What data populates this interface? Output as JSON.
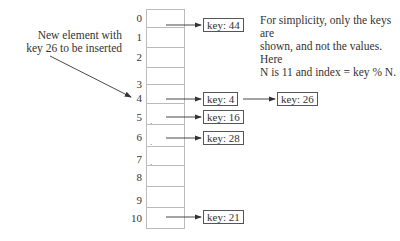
{
  "annotation": {
    "line1": "New element with",
    "line2": "key 26 to be inserted"
  },
  "note": {
    "line1": "For simplicity, only the keys are",
    "line2": "shown, and not the values. Here",
    "line3": "N is 11 and index = key % N."
  },
  "table": {
    "indices": [
      "0",
      "1",
      "2",
      "3",
      "4",
      "5",
      "6",
      "7",
      "8",
      "9",
      "10"
    ]
  },
  "entries": {
    "e0": "key: 44",
    "e4": "key: 4",
    "e4b": "key: 26",
    "e5": "key: 16",
    "e6": "key: 28",
    "e10": "key: 21"
  },
  "chain_map": [
    {
      "index": 0,
      "keys": [
        44
      ]
    },
    {
      "index": 4,
      "keys": [
        4,
        26
      ]
    },
    {
      "index": 5,
      "keys": [
        16
      ]
    },
    {
      "index": 6,
      "keys": [
        28
      ]
    },
    {
      "index": 10,
      "keys": [
        21
      ]
    }
  ]
}
